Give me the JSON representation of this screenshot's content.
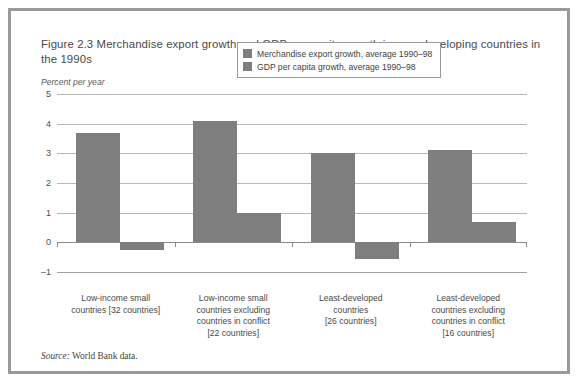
{
  "figure": {
    "title": "Figure 2.3  Merchandise export growth and GDP per capita growth in poor developing countries in the 1990s",
    "unit_label": "Percent per year",
    "source_prefix": "Source:",
    "source_text": " World Bank data."
  },
  "chart_data": {
    "type": "bar",
    "title": "Figure 2.3  Merchandise export growth and GDP per capita growth in poor developing countries in the 1990s",
    "xlabel": "",
    "ylabel": "Percent per year",
    "ylim": [
      -1,
      5
    ],
    "yticks": [
      5,
      4,
      3,
      2,
      1,
      0,
      -1
    ],
    "ytick_labels": [
      "5",
      "4",
      "3",
      "2",
      "1",
      "0",
      "–1"
    ],
    "grid": true,
    "legend_position": "upper center inside plot",
    "categories": [
      "Low-income small countries [32 countries]",
      "Low-income small countries excluding countries in conflict [22 countries]",
      "Least-developed countries [26 countries]",
      "Least-developed countries excluding countries in conflict [16 countries]"
    ],
    "category_lines": [
      [
        "Low-income small",
        "countries [32 countries]"
      ],
      [
        "Low-income small",
        "countries excluding",
        "countries in conflict",
        "[22 countries]"
      ],
      [
        "Least-developed",
        "countries",
        "[26 countries]"
      ],
      [
        "Least-developed",
        "countries excluding",
        "countries in conflict",
        "[16 countries]"
      ]
    ],
    "series": [
      {
        "name": "Merchandise export growth, average 1990–98",
        "color": "#7e7e7e",
        "values": [
          3.7,
          4.1,
          3.0,
          3.1
        ]
      },
      {
        "name": "GDP per capita growth, average 1990–98",
        "color": "#7e7e7e",
        "values": [
          -0.25,
          1.0,
          -0.55,
          0.7
        ]
      }
    ]
  },
  "legend": {
    "items": [
      {
        "label": "Merchandise export growth, average 1990–98"
      },
      {
        "label": "GDP per capita growth, average 1990–98"
      }
    ]
  }
}
